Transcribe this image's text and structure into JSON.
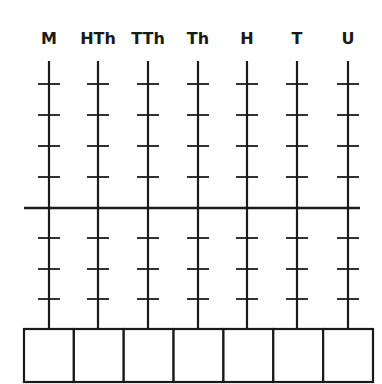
{
  "diagram": {
    "type": "place-value-abacus",
    "columns": [
      {
        "label": "M",
        "x": 49
      },
      {
        "label": "HTh",
        "x": 98
      },
      {
        "label": "TTh",
        "x": 148
      },
      {
        "label": "Th",
        "x": 198
      },
      {
        "label": "H",
        "x": 247
      },
      {
        "label": "T",
        "x": 297
      },
      {
        "label": "U",
        "x": 348
      }
    ],
    "upper_ticks_per_rod": 4,
    "lower_ticks_per_rod": 3,
    "answer_boxes": 7,
    "line_color": "#1a1a1a",
    "background": "#ffffff"
  }
}
